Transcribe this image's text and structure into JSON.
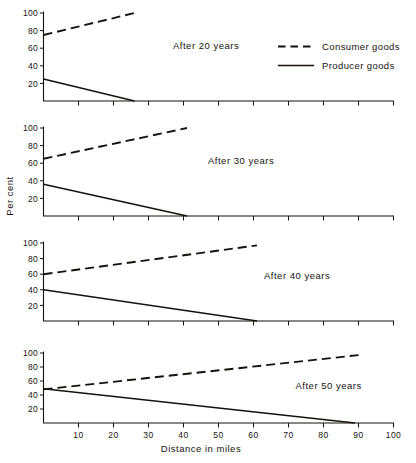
{
  "figure": {
    "axis_titles": {
      "x": "Distance in miles",
      "y": "Per cent"
    },
    "legend": {
      "items": [
        {
          "label": "Consumer goods",
          "style": "dashed"
        },
        {
          "label": "Producer goods",
          "style": "solid"
        }
      ]
    }
  },
  "chart_data": {
    "type": "line",
    "title": "",
    "xlabel": "Distance in miles",
    "ylabel": "Per cent",
    "xlim": [
      0,
      100
    ],
    "ylim": [
      0,
      100
    ],
    "xticks": [
      0,
      10,
      20,
      30,
      40,
      50,
      60,
      70,
      80,
      90,
      100
    ],
    "xtick_labels": [
      "",
      "10",
      "20",
      "30",
      "40",
      "50",
      "60",
      "70",
      "80",
      "90",
      "100"
    ],
    "yticks": [
      0,
      20,
      40,
      60,
      80,
      100
    ],
    "ytick_labels": [
      "",
      "20",
      "40",
      "60",
      "80",
      "100"
    ],
    "grid": false,
    "legend_position": "top-right",
    "panels": [
      {
        "id": "after-20-years",
        "title": "After 20 years",
        "title_x": 37,
        "series": [
          {
            "name": "Consumer goods",
            "style": "dashed",
            "x": [
              0,
              26
            ],
            "values": [
              75,
              100
            ]
          },
          {
            "name": "Producer goods",
            "style": "solid",
            "x": [
              0,
              26
            ],
            "values": [
              25,
              0
            ]
          }
        ]
      },
      {
        "id": "after-30-years",
        "title": "After 30 years",
        "title_x": 47,
        "series": [
          {
            "name": "Consumer goods",
            "style": "dashed",
            "x": [
              0,
              41
            ],
            "values": [
              65,
              100
            ]
          },
          {
            "name": "Producer goods",
            "style": "solid",
            "x": [
              0,
              41
            ],
            "values": [
              36,
              0
            ]
          }
        ]
      },
      {
        "id": "after-40-years",
        "title": "After 40 years",
        "title_x": 63,
        "series": [
          {
            "name": "Consumer goods",
            "style": "dashed",
            "x": [
              0,
              61
            ],
            "values": [
              60,
              97
            ]
          },
          {
            "name": "Producer goods",
            "style": "solid",
            "x": [
              0,
              61
            ],
            "values": [
              40,
              0
            ]
          }
        ]
      },
      {
        "id": "after-50-years",
        "title": "After 50 years",
        "title_x": 72,
        "series": [
          {
            "name": "Consumer goods",
            "style": "dashed",
            "x": [
              0,
              90
            ],
            "values": [
              48,
              97
            ]
          },
          {
            "name": "Producer goods",
            "style": "solid",
            "x": [
              0,
              89
            ],
            "values": [
              49,
              0
            ]
          }
        ]
      }
    ]
  }
}
